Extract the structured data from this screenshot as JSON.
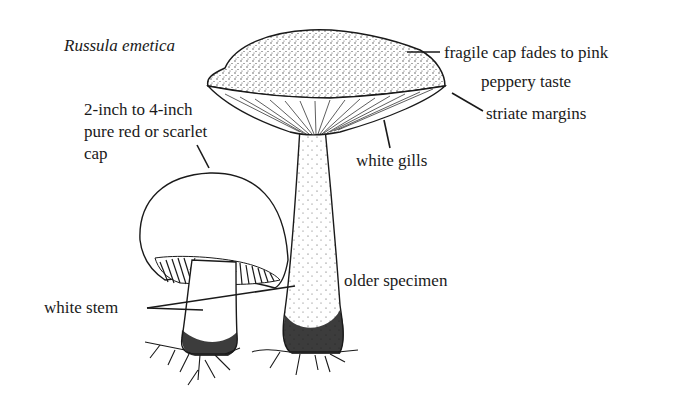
{
  "figure": {
    "title": "Russula emetica",
    "ink_color": "#1a1a1a",
    "background": "#ffffff"
  },
  "labels": {
    "cap_size": [
      "2-inch to 4-inch",
      "pure red or scarlet",
      "cap"
    ],
    "fragile_cap": "fragile cap fades to pink",
    "taste": "peppery taste",
    "margins": "striate margins",
    "gills": "white gills",
    "older": "older specimen",
    "stem": "white stem"
  }
}
